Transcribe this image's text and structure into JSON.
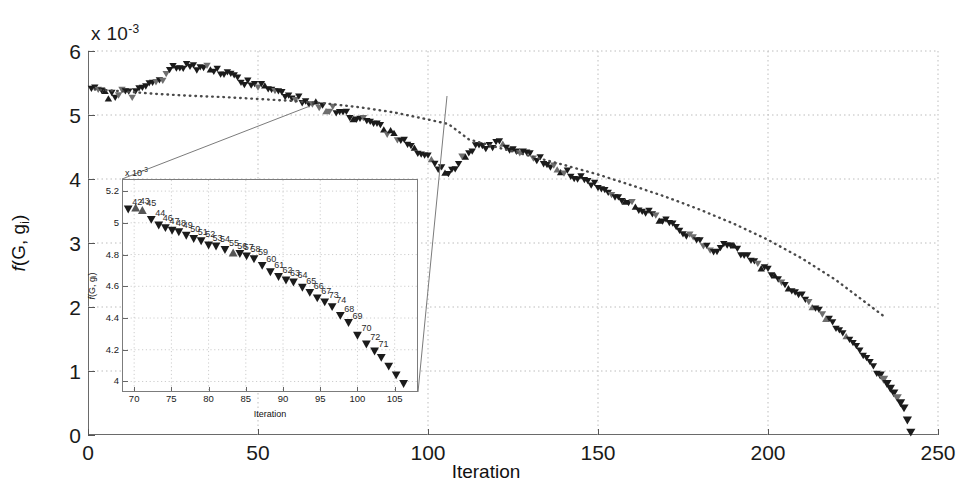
{
  "chart_data": {
    "type": "scatter",
    "title": "",
    "xlabel": "Iteration",
    "ylabel": "f(G, g_i)",
    "y_multiplier": "x 10",
    "y_multiplier_exp": "-3",
    "xlim": [
      0,
      250
    ],
    "ylim": [
      0,
      6
    ],
    "xticks": [
      0,
      50,
      100,
      150,
      200,
      250
    ],
    "yticks": [
      0,
      1,
      2,
      3,
      4,
      5,
      6
    ],
    "grid": true,
    "legend": null,
    "series": [
      {
        "name": "objective-markers",
        "marker": "triangle",
        "color": "#1c1c1c",
        "note": "dense noisy descending-triangle markers, one per iteration 1..242",
        "x": [
          1,
          4,
          7,
          10,
          13,
          16,
          19,
          22,
          25,
          28,
          31,
          34,
          37,
          40,
          43,
          46,
          49,
          52,
          55,
          58,
          61,
          64,
          67,
          70,
          73,
          76,
          79,
          82,
          85,
          88,
          91,
          94,
          97,
          100,
          103,
          106,
          109,
          112,
          115,
          118,
          121,
          124,
          127,
          130,
          133,
          136,
          139,
          142,
          145,
          148,
          151,
          154,
          157,
          160,
          163,
          166,
          169,
          172,
          175,
          178,
          181,
          184,
          187,
          190,
          193,
          196,
          199,
          202,
          205,
          208,
          211,
          214,
          217,
          220,
          223,
          226,
          229,
          232,
          235,
          238,
          240,
          242
        ],
        "y": [
          5.4,
          5.33,
          5.3,
          5.36,
          5.32,
          5.42,
          5.48,
          5.56,
          5.72,
          5.78,
          5.74,
          5.76,
          5.7,
          5.64,
          5.58,
          5.52,
          5.47,
          5.44,
          5.38,
          5.33,
          5.28,
          5.22,
          5.17,
          5.11,
          5.06,
          5.02,
          4.96,
          4.89,
          4.82,
          4.74,
          4.65,
          4.55,
          4.45,
          4.32,
          4.2,
          4.06,
          4.28,
          4.42,
          4.52,
          4.5,
          4.55,
          4.48,
          4.42,
          4.36,
          4.3,
          4.22,
          4.15,
          4.07,
          4.0,
          3.93,
          3.85,
          3.76,
          3.68,
          3.6,
          3.52,
          3.44,
          3.36,
          3.27,
          3.18,
          3.08,
          2.98,
          2.86,
          3.0,
          2.92,
          2.82,
          2.7,
          2.6,
          2.48,
          2.36,
          2.24,
          2.11,
          1.98,
          1.84,
          1.7,
          1.55,
          1.38,
          1.2,
          1.0,
          0.8,
          0.58,
          0.42,
          0.04
        ]
      },
      {
        "name": "fitted-trend",
        "marker": "dotted-line",
        "color": "#555555",
        "note": "smooth dotted reference curve",
        "x": [
          2,
          10,
          20,
          30,
          40,
          50,
          60,
          70,
          80,
          90,
          100,
          106,
          112,
          120,
          130,
          140,
          150,
          160,
          170,
          180,
          190,
          200,
          210,
          220,
          228,
          234
        ],
        "y": [
          5.4,
          5.37,
          5.33,
          5.3,
          5.28,
          5.25,
          5.22,
          5.18,
          5.12,
          5.04,
          4.93,
          4.86,
          4.62,
          4.5,
          4.36,
          4.22,
          4.07,
          3.9,
          3.72,
          3.52,
          3.3,
          3.05,
          2.76,
          2.42,
          2.1,
          1.86
        ]
      }
    ],
    "inset": {
      "type": "scatter",
      "xlabel": "Iteration",
      "ylabel": "f(G, g_i)",
      "y_multiplier": "x 10",
      "y_multiplier_exp": "-3",
      "xlim": [
        68.5,
        108
      ],
      "ylim": [
        3.94,
        5.27
      ],
      "xticks": [
        70,
        75,
        80,
        85,
        90,
        95,
        100,
        105
      ],
      "yticks": [
        4,
        4.2,
        4.4,
        4.6,
        4.8,
        5,
        5.2
      ],
      "ytick_labels": [
        "4",
        "4.2",
        "4.4",
        "4.6",
        "4.8",
        "5",
        "5.2"
      ],
      "grid": true,
      "points": [
        {
          "label": "42",
          "x": 69.2,
          "y": 5.085,
          "dir": "down"
        },
        {
          "label": "43",
          "x": 70.2,
          "y": 5.095,
          "dir": "up"
        },
        {
          "label": "45",
          "x": 71.1,
          "y": 5.08,
          "dir": "up"
        },
        {
          "label": "44",
          "x": 72.3,
          "y": 5.02,
          "dir": "down"
        },
        {
          "label": "46",
          "x": 73.3,
          "y": 4.985,
          "dir": "down"
        },
        {
          "label": "47",
          "x": 74.2,
          "y": 4.968,
          "dir": "down"
        },
        {
          "label": "48",
          "x": 75.1,
          "y": 4.952,
          "dir": "down"
        },
        {
          "label": "49",
          "x": 76.0,
          "y": 4.942,
          "dir": "down"
        },
        {
          "label": "50",
          "x": 77.0,
          "y": 4.92,
          "dir": "down"
        },
        {
          "label": "51",
          "x": 78.0,
          "y": 4.9,
          "dir": "down"
        },
        {
          "label": "52",
          "x": 79.0,
          "y": 4.885,
          "dir": "down"
        },
        {
          "label": "53",
          "x": 80.0,
          "y": 4.858,
          "dir": "down"
        },
        {
          "label": "54",
          "x": 81.0,
          "y": 4.852,
          "dir": "down"
        },
        {
          "label": "55",
          "x": 82.2,
          "y": 4.83,
          "dir": "down"
        },
        {
          "label": "56",
          "x": 83.3,
          "y": 4.812,
          "dir": "up"
        },
        {
          "label": "57",
          "x": 84.2,
          "y": 4.805,
          "dir": "down"
        },
        {
          "label": "58",
          "x": 85.1,
          "y": 4.79,
          "dir": "down"
        },
        {
          "label": "59",
          "x": 86.1,
          "y": 4.772,
          "dir": "down"
        },
        {
          "label": "60",
          "x": 87.2,
          "y": 4.73,
          "dir": "down"
        },
        {
          "label": "61",
          "x": 88.3,
          "y": 4.69,
          "dir": "down"
        },
        {
          "label": "62",
          "x": 89.4,
          "y": 4.66,
          "dir": "down"
        },
        {
          "label": "63",
          "x": 90.4,
          "y": 4.638,
          "dir": "down"
        },
        {
          "label": "64",
          "x": 91.4,
          "y": 4.625,
          "dir": "down"
        },
        {
          "label": "65",
          "x": 92.6,
          "y": 4.592,
          "dir": "down"
        },
        {
          "label": "66",
          "x": 93.6,
          "y": 4.56,
          "dir": "down"
        },
        {
          "label": "67",
          "x": 94.6,
          "y": 4.525,
          "dir": "down"
        },
        {
          "label": "73",
          "x": 95.6,
          "y": 4.5,
          "dir": "down"
        },
        {
          "label": "74",
          "x": 96.6,
          "y": 4.47,
          "dir": "down"
        },
        {
          "label": "68",
          "x": 97.7,
          "y": 4.415,
          "dir": "down"
        },
        {
          "label": "69",
          "x": 98.8,
          "y": 4.37,
          "dir": "down"
        },
        {
          "label": "70",
          "x": 100.0,
          "y": 4.29,
          "dir": "down"
        },
        {
          "label": "72",
          "x": 101.2,
          "y": 4.235,
          "dir": "down"
        },
        {
          "label": "71",
          "x": 102.3,
          "y": 4.19,
          "dir": "down"
        },
        {
          "label": "",
          "x": 103.2,
          "y": 4.15,
          "dir": "down"
        },
        {
          "label": "",
          "x": 104.2,
          "y": 4.095,
          "dir": "down"
        },
        {
          "label": "",
          "x": 105.2,
          "y": 4.04,
          "dir": "down"
        },
        {
          "label": "",
          "x": 106.2,
          "y": 3.985,
          "dir": "down"
        }
      ]
    },
    "callout_lines": [
      {
        "from": [
          310,
          106
        ],
        "to": [
          122,
          179
        ]
      },
      {
        "from": [
          447,
          96
        ],
        "to": [
          418,
          392
        ]
      }
    ]
  }
}
